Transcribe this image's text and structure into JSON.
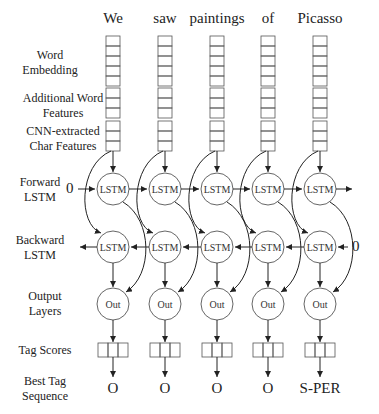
{
  "words": [
    "We",
    "saw",
    "paintings",
    "of",
    "Picasso"
  ],
  "row_labels": {
    "word_embedding": "Word Embedding",
    "additional_features": "Additional Word Features",
    "char_features": "CNN-extracted Char Features",
    "forward_lstm": "Forward LSTM",
    "backward_lstm": "Backward LSTM",
    "output_layers": "Output Layers",
    "tag_scores": "Tag Scores",
    "best_tag_sequence": "Best Tag Sequence"
  },
  "nodes": {
    "lstm": "LSTM",
    "out": "Out",
    "init_forward": "0",
    "init_backward": "0"
  },
  "tags": [
    "O",
    "O",
    "O",
    "O",
    "S-PER"
  ],
  "layout": {
    "columns_x": [
      113,
      165,
      217,
      268,
      320
    ],
    "word_embedding_cells": 5,
    "additional_feature_cells": 3,
    "char_feature_cells": 3,
    "tag_score_cells": 3
  }
}
